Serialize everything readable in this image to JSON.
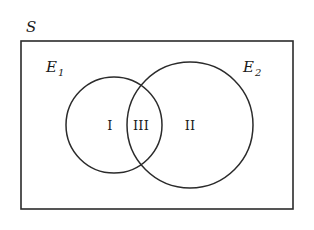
{
  "figure": {
    "type": "venn-diagram",
    "background_color": "#ffffff",
    "stroke_color": "#2b2b2b",
    "text_color": "#1a1a1a",
    "width": 314,
    "height": 230
  },
  "universe": {
    "label": "S",
    "rect": {
      "x": 21,
      "y": 41,
      "width": 272,
      "height": 168
    },
    "label_position": {
      "x": 26,
      "y": 32
    }
  },
  "sets": [
    {
      "name": "set-e1",
      "label_base": "E",
      "label_sub": "1",
      "label_position": {
        "x": 46,
        "y": 72
      },
      "circle": {
        "cx": 114,
        "cy": 125,
        "r": 48
      }
    },
    {
      "name": "set-e2",
      "label_base": "E",
      "label_sub": "2",
      "label_position": {
        "x": 243,
        "y": 72
      },
      "circle": {
        "cx": 190,
        "cy": 125,
        "r": 63
      }
    }
  ],
  "regions": [
    {
      "name": "region-one",
      "label": "I",
      "meaning": "E1 only",
      "position": {
        "x": 110,
        "y": 130
      }
    },
    {
      "name": "region-three",
      "label": "III",
      "meaning": "E1 intersect E2",
      "position": {
        "x": 141,
        "y": 130
      }
    },
    {
      "name": "region-two",
      "label": "II",
      "meaning": "E2 only",
      "position": {
        "x": 190,
        "y": 130
      }
    }
  ]
}
